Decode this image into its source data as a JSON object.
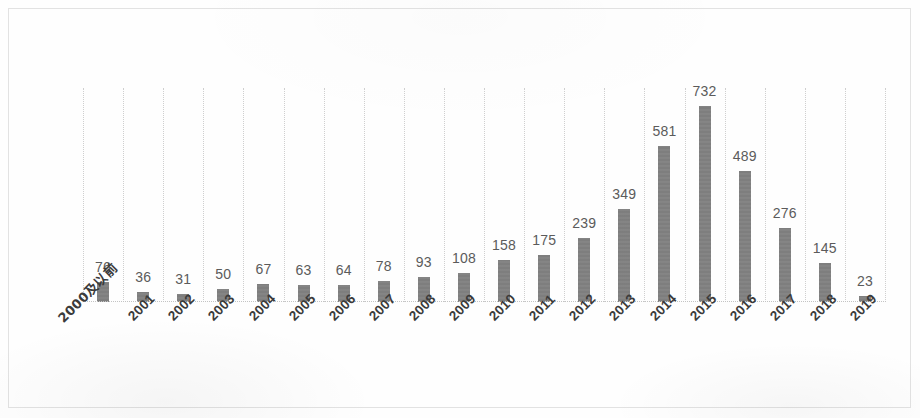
{
  "chart_data": {
    "type": "bar",
    "title": "",
    "subtitle": "",
    "xlabel": "",
    "ylabel": "",
    "grid": "vertical-dotted",
    "legend": "none",
    "ylim": [
      0,
      800
    ],
    "categories": [
      "2000及以前",
      "2001",
      "2002",
      "2003",
      "2004",
      "2005",
      "2006",
      "2007",
      "2008",
      "2009",
      "2010",
      "2011",
      "2012",
      "2013",
      "2014",
      "2015",
      "2016",
      "2017",
      "2018",
      "2019"
    ],
    "values": [
      76,
      36,
      31,
      50,
      67,
      63,
      64,
      78,
      93,
      108,
      158,
      175,
      239,
      349,
      581,
      732,
      489,
      276,
      145,
      23
    ],
    "data_labels": [
      "76",
      "36",
      "31",
      "50",
      "67",
      "63",
      "64",
      "78",
      "93",
      "108",
      "158",
      "175",
      "239",
      "349",
      "581",
      "732",
      "489",
      "276",
      "145",
      "23"
    ],
    "colors": {
      "bar": "#7b7b7b",
      "gridline": "#cfcfcf",
      "baseline": "#c4c4c4",
      "data_label_text": "#5b5b5b",
      "category_label_text": "#3b3b3b",
      "page_border": "#e2e2e2",
      "background": "#fefefe"
    }
  }
}
